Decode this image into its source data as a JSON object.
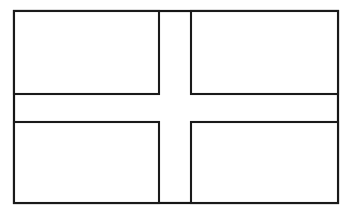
{
  "document": {
    "title": "Nordic cross flag outline",
    "subject": "flag-of-denmark-line-drawing",
    "background_color": "#ffffff",
    "ink_color": "#151515",
    "canvas": {
      "width": 358,
      "height": 211
    }
  },
  "drawing": {
    "type": "line-art",
    "stroke_width": 2.2,
    "outer_border": {
      "label": "flag-border",
      "x": 14,
      "y": 11,
      "width": 324,
      "height": 192
    },
    "cross": {
      "label": "nordic-cross",
      "vertical_band": {
        "x": 159,
        "width": 32
      },
      "horizontal_band": {
        "y": 94,
        "height": 28
      },
      "offset_description": "vertical band set left of center"
    },
    "quadrants": [
      {
        "name": "upper-hoist-panel",
        "position": "top-left",
        "x": 14,
        "y": 11,
        "width": 145,
        "height": 83
      },
      {
        "name": "upper-fly-panel",
        "position": "top-right",
        "x": 191,
        "y": 11,
        "width": 147,
        "height": 83
      },
      {
        "name": "lower-hoist-panel",
        "position": "bottom-left",
        "x": 14,
        "y": 122,
        "width": 145,
        "height": 81
      },
      {
        "name": "lower-fly-panel",
        "position": "bottom-right",
        "x": 191,
        "y": 122,
        "width": 147,
        "height": 81
      }
    ]
  },
  "labels": {
    "figure_caption": ""
  }
}
